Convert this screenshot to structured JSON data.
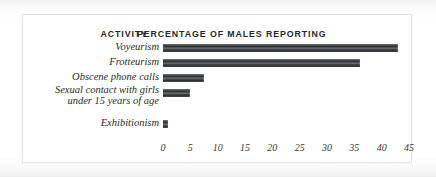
{
  "chart_data": {
    "type": "bar",
    "orientation": "horizontal",
    "title": "",
    "xlabel": "PERCENTAGE OF MALES REPORTING",
    "ylabel": "ACTIVITY",
    "categories": [
      "Voyeurism",
      "Frotteurism",
      "Obscene phone calls",
      "Sexual contact with girls\nunder 15 years of age",
      "Exhibitionism"
    ],
    "values": [
      43,
      36,
      7.5,
      5,
      1
    ],
    "xlim": [
      0,
      45
    ],
    "xticks": [
      0,
      5,
      10,
      15,
      20,
      25,
      30,
      35,
      40,
      45
    ],
    "xtick_labels": [
      "0",
      "5",
      "10",
      "15",
      "20",
      "25",
      "30",
      "35",
      "40",
      "45"
    ],
    "grid": false,
    "legend": false,
    "bar_color": "#33373a"
  },
  "headers": {
    "activity": "ACTIVITY",
    "percentage": "PERCENTAGE OF MALES REPORTING"
  },
  "colors": {
    "page_background": "#fdfdfd",
    "panel_background": "#ffffff",
    "panel_border": "#e2e2e2",
    "bar_dark": "#2a2c2e",
    "bar_light": "#777b7e",
    "text": "#2b2b2b"
  }
}
